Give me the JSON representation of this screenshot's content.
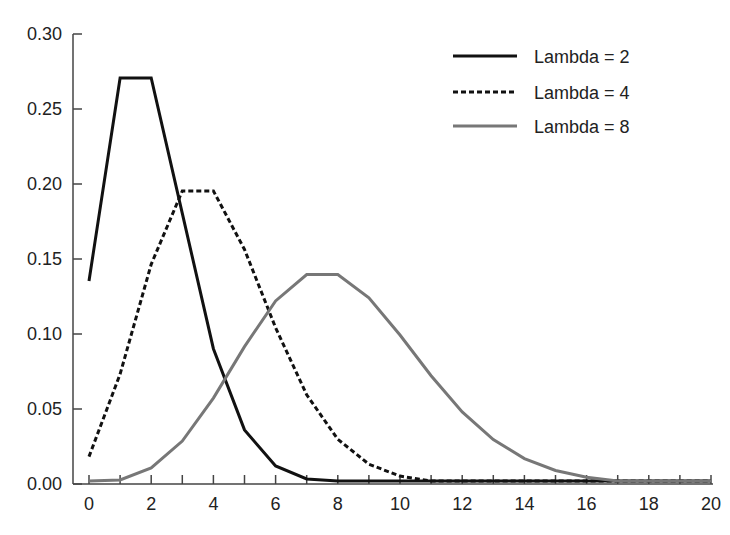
{
  "chart_data": {
    "type": "line",
    "title": "",
    "xlabel": "",
    "ylabel": "",
    "xlim": [
      0,
      20
    ],
    "ylim": [
      0,
      0.3
    ],
    "grid": false,
    "legend_position": "upper right",
    "x": [
      0,
      1,
      2,
      3,
      4,
      5,
      6,
      7,
      8,
      9,
      10,
      11,
      12,
      13,
      14,
      15,
      16,
      17,
      18,
      19,
      20
    ],
    "x_ticks": [
      0,
      2,
      4,
      6,
      8,
      10,
      12,
      14,
      16,
      18,
      20
    ],
    "x_tick_labels": [
      "0",
      "2",
      "4",
      "6",
      "8",
      "10",
      "12",
      "14",
      "16",
      "18",
      "20"
    ],
    "y_ticks": [
      0,
      0.05,
      0.1,
      0.15,
      0.2,
      0.25,
      0.3
    ],
    "y_tick_labels": [
      "0.00",
      "0.05",
      "0.10",
      "0.15",
      "0.20",
      "0.25",
      "0.30"
    ],
    "series": [
      {
        "name": "Lambda = 2",
        "style": "solid",
        "color": "#111111",
        "values": [
          0.1353,
          0.2707,
          0.2707,
          0.1804,
          0.0902,
          0.0361,
          0.012,
          0.0034,
          0.0009,
          0.0002,
          0.0,
          0.0,
          0.0,
          0.0,
          0.0,
          0.0,
          0.0,
          0.0,
          0.0,
          0.0,
          0.0
        ]
      },
      {
        "name": "Lambda = 4",
        "style": "dotted",
        "color": "#111111",
        "values": [
          0.0183,
          0.0733,
          0.1465,
          0.1954,
          0.1954,
          0.1563,
          0.1042,
          0.0595,
          0.0298,
          0.0132,
          0.0053,
          0.0019,
          0.0006,
          0.0002,
          0.0001,
          0.0,
          0.0,
          0.0,
          0.0,
          0.0,
          0.0
        ]
      },
      {
        "name": "Lambda = 8",
        "style": "solid",
        "color": "#777777",
        "values": [
          0.0003,
          0.0027,
          0.0107,
          0.0286,
          0.0573,
          0.0916,
          0.1221,
          0.1396,
          0.1396,
          0.1241,
          0.0993,
          0.0722,
          0.0481,
          0.0296,
          0.0169,
          0.009,
          0.0045,
          0.0021,
          0.0009,
          0.0004,
          0.0002
        ]
      }
    ]
  }
}
